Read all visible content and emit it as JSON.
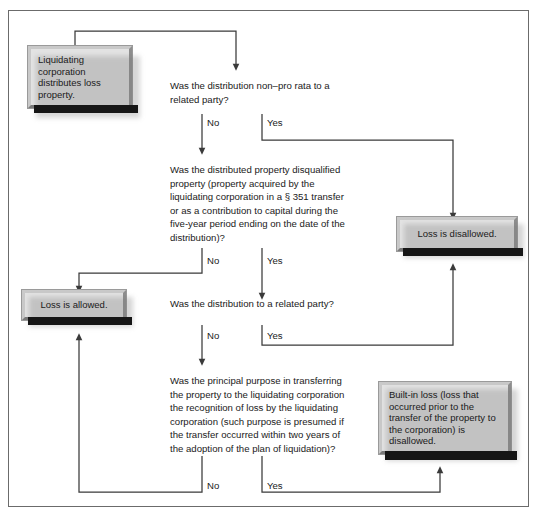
{
  "diagram": {
    "colors": {
      "page_background": "#ffffff",
      "frame_border": "#6b6b6b",
      "box_face": "#e3e3e3",
      "box_bevel_light": "#c9c9c9",
      "box_bevel_dark": "#7a7a7a",
      "box_shadow": "#161616",
      "line": "#3a3a3a",
      "text": "#1a1a1a"
    }
  },
  "nodes": {
    "start": {
      "label": "Liquidating corporation distributes loss property.",
      "name": "start-box"
    },
    "loss_disallowed": {
      "label": "Loss is disallowed.",
      "name": "loss-disallowed-box"
    },
    "loss_allowed": {
      "label": "Loss is allowed.",
      "name": "loss-allowed-box"
    },
    "built_in_loss": {
      "label": "Built-in loss (loss that occurred prior to the transfer of the property to the corporation) is disallowed.",
      "name": "built-in-loss-box"
    }
  },
  "questions": {
    "q1": "Was the distribution non–pro rata to a\nrelated party?",
    "q2": "Was the distributed property disqualified\nproperty (property acquired by the\nliquidating corporation in a § 351 transfer\nor as a contribution to capital during the\nfive-year period ending on the date of the\ndistribution)?",
    "q3": "Was the distribution to a related party?",
    "q4": "Was the principal purpose in transferring\nthe property to the liquidating corporation\nthe recognition of loss by the liquidating\ncorporation (such purpose is presumed if\nthe transfer occurred within two years of\nthe adoption of the plan of liquidation)?"
  },
  "edge_labels": {
    "q1_no": "No",
    "q1_yes": "Yes",
    "q2_no": "No",
    "q2_yes": "Yes",
    "q3_no": "No",
    "q3_yes": "Yes",
    "q4_no": "No",
    "q4_yes": "Yes"
  }
}
